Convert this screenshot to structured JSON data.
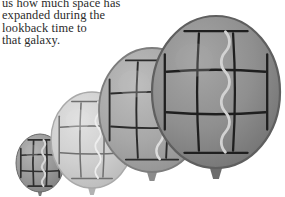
{
  "caption": {
    "lines": [
      "us how much space has",
      "expanded during the",
      "lookback time to",
      "that galaxy."
    ],
    "text_color": "#2b2b2b"
  },
  "figure": {
    "name": "expanding-space-balloon-sequence",
    "background_color": "#ffffff",
    "balloon_count": 4,
    "balloons": [
      {
        "label": "balloon-1-smallest",
        "order": 1,
        "center_x": 40,
        "center_y": 163,
        "radius_x": 24,
        "radius_y": 29,
        "fill_color": "#9a9a9a",
        "fill_color_light": "#b4b4b4",
        "fill_color_dark": "#7c7c7c",
        "rim_color": "#6a6a6a",
        "grid_color": "#2e2e2e",
        "grid_width": 1.7,
        "wave_color": "#d7d7d7",
        "wave_width": 2.0,
        "grid_rows": 3,
        "grid_cols": 3,
        "knot_color": "#7a7a7a"
      },
      {
        "label": "balloon-2",
        "order": 2,
        "center_x": 92,
        "center_y": 140,
        "radius_x": 41,
        "radius_y": 48,
        "fill_color": "#cfcfcf",
        "fill_color_light": "#e1e1e1",
        "fill_color_dark": "#b6b6b6",
        "rim_color": "#a9a9a9",
        "grid_color": "#6f6f6f",
        "grid_width": 1.5,
        "wave_color": "#ededed",
        "wave_width": 2.0,
        "grid_rows": 3,
        "grid_cols": 3,
        "knot_color": "#b2b2b2"
      },
      {
        "label": "balloon-3",
        "order": 3,
        "center_x": 152,
        "center_y": 110,
        "radius_x": 53,
        "radius_y": 62,
        "fill_color": "#a8a8a8",
        "fill_color_light": "#bdbdbd",
        "fill_color_dark": "#8d8d8d",
        "rim_color": "#7d7d7d",
        "grid_color": "#2b2b2b",
        "grid_width": 1.9,
        "wave_color": "#dcdcdc",
        "wave_width": 2.4,
        "grid_rows": 3,
        "grid_cols": 3,
        "knot_color": "#8b8b8b"
      },
      {
        "label": "balloon-4-largest",
        "order": 4,
        "center_x": 216,
        "center_y": 92,
        "radius_x": 64,
        "radius_y": 76,
        "fill_color": "#8f8f8f",
        "fill_color_light": "#a6a6a6",
        "fill_color_dark": "#6e6e6e",
        "rim_color": "#5f5f5f",
        "grid_color": "#1f1f1f",
        "grid_width": 2.3,
        "wave_color": "#d2d2d2",
        "wave_width": 2.8,
        "grid_rows": 3,
        "grid_cols": 3,
        "knot_color": "#6c6c6c"
      }
    ]
  }
}
